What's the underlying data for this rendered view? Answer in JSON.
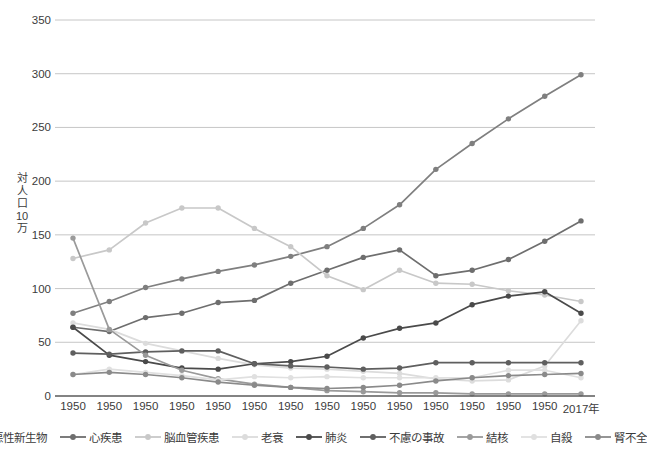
{
  "chart_data": {
    "type": "line",
    "title": "",
    "xlabel": "",
    "ylabel": "対人口10万",
    "ylabel_chars": [
      "対",
      "人",
      "口",
      "10",
      "万"
    ],
    "ylim": [
      0,
      350
    ],
    "ytick_values": [
      0,
      50,
      100,
      150,
      200,
      250,
      300,
      350
    ],
    "ytick_labels": [
      "0",
      "50",
      "100",
      "150",
      "200",
      "250",
      "300",
      "350"
    ],
    "grid": true,
    "legend_position": "bottom",
    "categories": [
      "1950",
      "1950",
      "1950",
      "1950",
      "1950",
      "1950",
      "1950",
      "1950",
      "1950",
      "1950",
      "1950",
      "1950",
      "1950",
      "1950",
      "2017年"
    ],
    "series": [
      {
        "name": "悪性新生物",
        "color": "#7f7f7f",
        "values": [
          77,
          88,
          101,
          109,
          116,
          122,
          130,
          139,
          156,
          178,
          211,
          235,
          258,
          279,
          299
        ]
      },
      {
        "name": "心疾患",
        "color": "#6e6e6e",
        "values": [
          64,
          60,
          73,
          77,
          87,
          89,
          105,
          117,
          129,
          136,
          112,
          117,
          127,
          144,
          163
        ]
      },
      {
        "name": "脳血管疾患",
        "color": "#c8c8c8",
        "values": [
          128,
          136,
          161,
          175,
          175,
          156,
          139,
          112,
          99,
          117,
          105,
          104,
          98,
          94,
          88
        ]
      },
      {
        "name": "老衰",
        "color": "#dcdcdc",
        "values": [
          68,
          62,
          49,
          42,
          35,
          29,
          26,
          25,
          23,
          21,
          16,
          14,
          15,
          28,
          70
        ]
      },
      {
        "name": "肺炎",
        "color": "#4a4a4a",
        "values": [
          64,
          38,
          32,
          26,
          25,
          30,
          32,
          37,
          54,
          63,
          68,
          85,
          93,
          97,
          77
        ]
      },
      {
        "name": "不慮の事故",
        "color": "#5f5f5f",
        "values": [
          40,
          39,
          41,
          42,
          42,
          30,
          28,
          27,
          25,
          26,
          31,
          31,
          31,
          31,
          31
        ]
      },
      {
        "name": "結核",
        "color": "#9a9a9a",
        "values": [
          147,
          62,
          38,
          24,
          16,
          11,
          8,
          5,
          4,
          3,
          3,
          2,
          2,
          2,
          2
        ]
      },
      {
        "name": "自殺",
        "color": "#e0e0e0",
        "values": [
          20,
          25,
          22,
          19,
          15,
          18,
          17,
          18,
          17,
          17,
          17,
          17,
          24,
          24,
          17
        ]
      },
      {
        "name": "腎不全",
        "color": "#8a8a8a",
        "values": [
          20,
          22,
          20,
          17,
          13,
          10,
          8,
          7,
          8,
          10,
          14,
          17,
          19,
          20,
          21
        ]
      }
    ]
  }
}
